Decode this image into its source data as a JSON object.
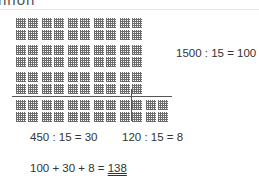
{
  "heading": "nnon",
  "grid": {
    "rows_above_line": 3,
    "columns": 5,
    "blocks_below_line": 6,
    "block_value": 100
  },
  "equations": {
    "main": "1500 : 15 = 100",
    "left_part": "450 : 15 = 30",
    "right_part": "120 : 15 = 8",
    "sum_prefix": "100 + 30 + 8 = ",
    "sum_result": "138"
  }
}
